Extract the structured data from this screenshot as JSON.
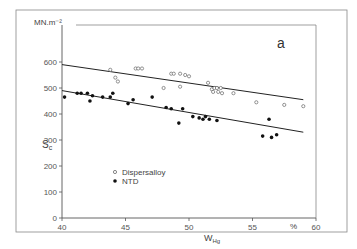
{
  "chart_data": {
    "type": "scatter",
    "title": "",
    "panel_label": "a",
    "xlabel": "W_Hg",
    "xlabel_main": "W",
    "xlabel_sub": "Hg",
    "xunit": "%",
    "ylabel": "S_c",
    "ylabel_main": "S",
    "ylabel_sub": "c",
    "yunit": "MN.m⁻²",
    "xlim": [
      40,
      60
    ],
    "ylim": [
      0,
      650
    ],
    "xticks": [
      40,
      45,
      50,
      55,
      60
    ],
    "yticks": [
      0,
      100,
      200,
      300,
      400,
      500,
      600
    ],
    "grid": false,
    "legend_position": "lower-left-inside",
    "series": [
      {
        "name": "Dispersalloy",
        "marker": "open-circle",
        "points": [
          [
            43.8,
            570
          ],
          [
            44.2,
            540
          ],
          [
            44.4,
            525
          ],
          [
            45.8,
            575
          ],
          [
            46.0,
            575
          ],
          [
            46.3,
            575
          ],
          [
            48.0,
            500
          ],
          [
            48.6,
            555
          ],
          [
            48.8,
            555
          ],
          [
            49.3,
            555
          ],
          [
            49.7,
            550
          ],
          [
            50.0,
            545
          ],
          [
            49.3,
            505
          ],
          [
            51.5,
            520
          ],
          [
            51.8,
            495
          ],
          [
            52.0,
            500
          ],
          [
            52.2,
            500
          ],
          [
            52.5,
            500
          ],
          [
            51.9,
            485
          ],
          [
            52.3,
            485
          ],
          [
            52.6,
            480
          ],
          [
            53.5,
            480
          ],
          [
            55.3,
            445
          ],
          [
            57.5,
            435
          ],
          [
            59.0,
            430
          ]
        ],
        "fit_line": [
          [
            40,
            590
          ],
          [
            59,
            455
          ]
        ]
      },
      {
        "name": "NTD",
        "marker": "filled-circle",
        "points": [
          [
            40.2,
            465
          ],
          [
            41.2,
            480
          ],
          [
            41.5,
            480
          ],
          [
            42.0,
            480
          ],
          [
            42.2,
            450
          ],
          [
            42.4,
            470
          ],
          [
            43.2,
            465
          ],
          [
            43.8,
            465
          ],
          [
            44.0,
            480
          ],
          [
            45.2,
            440
          ],
          [
            45.6,
            455
          ],
          [
            47.1,
            465
          ],
          [
            48.2,
            425
          ],
          [
            48.6,
            420
          ],
          [
            49.2,
            365
          ],
          [
            49.5,
            420
          ],
          [
            50.3,
            390
          ],
          [
            50.8,
            385
          ],
          [
            51.1,
            380
          ],
          [
            51.3,
            390
          ],
          [
            51.6,
            380
          ],
          [
            52.2,
            375
          ],
          [
            55.8,
            315
          ],
          [
            56.3,
            380
          ],
          [
            56.5,
            310
          ],
          [
            56.9,
            320
          ]
        ],
        "fit_line": [
          [
            40,
            490
          ],
          [
            59,
            330
          ]
        ]
      }
    ]
  }
}
